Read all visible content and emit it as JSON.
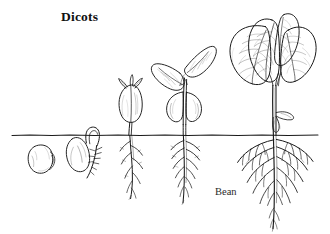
{
  "figure": {
    "title": "Dicots",
    "specimen_label": "Bean",
    "background_color": "#ffffff",
    "ink_color": "#1a1a1a",
    "style": "pen-and-ink botanical line drawing",
    "width": 330,
    "height": 234
  },
  "soil_line": {
    "name": "ground-level-line",
    "y": 135,
    "x_start": 12,
    "x_end": 318,
    "color": "#1a1a1a"
  },
  "stages": [
    {
      "index": 1,
      "name": "dormant-seed",
      "label": "",
      "description": "kidney-shaped bean seed lying below soil line, hilum visible",
      "center_x": 45,
      "center_y": 160,
      "above_ground": false
    },
    {
      "index": 2,
      "name": "germinating-seed",
      "label": "",
      "description": "seed with emerging radicle and hypocotyl hook breaking the soil surface",
      "center_x": 84,
      "center_y": 158,
      "above_ground": true
    },
    {
      "index": 3,
      "name": "emerging-seedling",
      "label": "",
      "description": "hypocotyl straightened, closed cotyledons above ground with first tiny leaves, taproot with laterals",
      "center_x": 136,
      "center_y": 130,
      "above_ground": true
    },
    {
      "index": 4,
      "name": "young-seedling",
      "label": "",
      "description": "two unfolded true leaves, cotyledons still attached and curling, branching taproot",
      "center_x": 181,
      "center_y": 120,
      "above_ground": true
    },
    {
      "index": 5,
      "name": "mature-seedling",
      "label": "Bean",
      "description": "tall stem with four large veined leaves, shriveled cotyledon remnant on stem, extensive branched taproot system",
      "center_x": 272,
      "center_y": 110,
      "above_ground": true
    }
  ]
}
